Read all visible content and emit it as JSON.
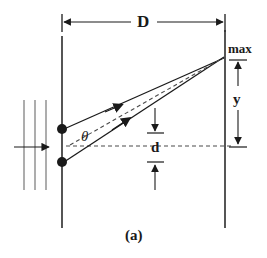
{
  "figure": {
    "caption": "(a)",
    "colors": {
      "ink": "#1a1a1a",
      "wavefront": "#808080",
      "background": "#ffffff"
    },
    "labels": {
      "distance_D": "D",
      "maximum": "max",
      "fringe_position_y": "y",
      "angle_theta": "θ",
      "slit_separation_d": "d"
    },
    "elements": {
      "slit_plane_label": "slit plane (barrier with two slits)",
      "screen_label": "viewing screen",
      "slit_top_label": "upper slit source",
      "slit_bottom_label": "lower slit source",
      "incoming_wave_label": "incident plane wavefronts",
      "ray_upper_label": "ray from upper slit",
      "ray_lower_label": "ray from lower slit",
      "axis_label": "central axis"
    }
  }
}
